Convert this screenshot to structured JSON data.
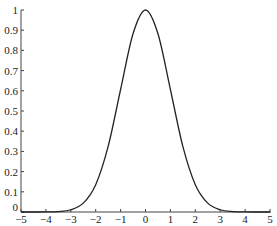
{
  "chart_data": {
    "type": "line",
    "title": "",
    "xlabel": "",
    "ylabel": "",
    "xlim": [
      -5,
      5
    ],
    "ylim": [
      0,
      1
    ],
    "grid": false,
    "legend": null,
    "x_ticks": [
      "-5",
      "-4",
      "-3",
      "-2",
      "-1",
      "0",
      "1",
      "2",
      "3",
      "4",
      "5"
    ],
    "y_ticks": [
      "0",
      "0.1",
      "0.2",
      "0.3",
      "0.4",
      "0.5",
      "0.6",
      "0.7",
      "0.8",
      "0.9",
      "1"
    ],
    "series": [
      {
        "name": "exp(-x^2/2)",
        "color": "#222222",
        "x": [
          -5,
          -4.5,
          -4,
          -3.5,
          -3,
          -2.5,
          -2,
          -1.5,
          -1,
          -0.5,
          0,
          0.5,
          1,
          1.5,
          2,
          2.5,
          3,
          3.5,
          4,
          4.5,
          5
        ],
        "values": [
          0.0,
          0.0,
          0.0003,
          0.0022,
          0.0111,
          0.0439,
          0.1353,
          0.3247,
          0.6065,
          0.8825,
          1.0,
          0.8825,
          0.6065,
          0.3247,
          0.1353,
          0.0439,
          0.0111,
          0.0022,
          0.0003,
          0.0,
          0.0
        ]
      }
    ]
  }
}
